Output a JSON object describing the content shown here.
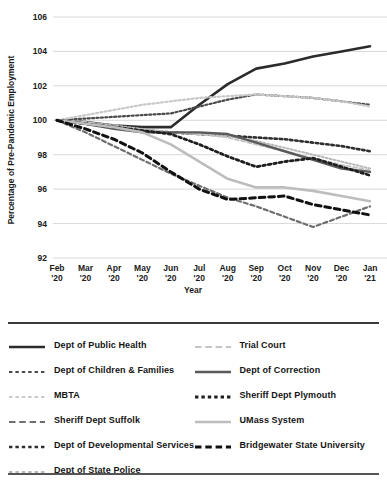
{
  "chart_data": {
    "type": "line",
    "title": "",
    "xlabel": "Year",
    "ylabel": "Percentage of Pre-Pandemic Employment",
    "categories": [
      "Feb '20",
      "Mar '20",
      "Apr '20",
      "May '20",
      "Jun '20",
      "Jul '20",
      "Aug '20",
      "Sep '20",
      "Oct '20",
      "Nov '20",
      "Dec '20",
      "Jan '21"
    ],
    "ylim": [
      92,
      106
    ],
    "yticks": [
      92,
      94,
      96,
      98,
      100,
      102,
      104,
      106
    ],
    "grid": true,
    "legend_position": "below",
    "series": [
      {
        "name": "Dept of Public Health",
        "color": "#2b2b2b",
        "style": "solid",
        "width": 2.6,
        "values": [
          100.0,
          99.9,
          99.7,
          99.6,
          99.6,
          100.9,
          102.1,
          103.0,
          103.3,
          103.7,
          104.0,
          104.3
        ]
      },
      {
        "name": "Dept of Children & Families",
        "color": "#4a4a4a",
        "style": "dotted",
        "width": 2.2,
        "values": [
          100.0,
          100.1,
          100.2,
          100.3,
          100.4,
          100.8,
          101.2,
          101.5,
          101.4,
          101.3,
          101.1,
          100.9
        ]
      },
      {
        "name": "MBTA",
        "color": "#c9c9c9",
        "style": "dotted",
        "width": 2.2,
        "values": [
          100.0,
          100.3,
          100.6,
          100.9,
          101.1,
          101.3,
          101.4,
          101.5,
          101.4,
          101.3,
          101.1,
          100.8
        ]
      },
      {
        "name": "Sheriff Dept Suffolk",
        "color": "#6e6e6e",
        "style": "dashed",
        "width": 2.2,
        "values": [
          100.0,
          99.3,
          98.5,
          97.7,
          96.9,
          96.2,
          95.5,
          95.0,
          94.4,
          93.8,
          94.4,
          95.0
        ]
      },
      {
        "name": "Dept of Developmental Services",
        "color": "#2e2e2e",
        "style": "dotted",
        "width": 2.6,
        "values": [
          100.0,
          99.8,
          99.6,
          99.4,
          99.3,
          99.2,
          99.1,
          99.0,
          98.9,
          98.7,
          98.5,
          98.2
        ]
      },
      {
        "name": "Dept of State Police",
        "color": "#b8b8b8",
        "style": "dotted",
        "width": 2.0,
        "values": [
          100.0,
          99.9,
          99.7,
          99.5,
          99.3,
          99.2,
          99.1,
          98.8,
          98.4,
          98.0,
          97.6,
          97.2
        ]
      },
      {
        "name": "Trial Court",
        "color": "#c4c4c4",
        "style": "dashed",
        "width": 2.0,
        "values": [
          100.0,
          99.9,
          99.6,
          99.4,
          99.3,
          99.2,
          99.0,
          98.6,
          98.2,
          97.8,
          97.4,
          97.1
        ]
      },
      {
        "name": "Dept of Correction",
        "color": "#5a5a5a",
        "style": "solid",
        "width": 2.4,
        "values": [
          100.0,
          99.8,
          99.5,
          99.3,
          99.3,
          99.3,
          99.2,
          98.7,
          98.2,
          97.7,
          97.2,
          97.0
        ]
      },
      {
        "name": "Sheriff Dept Plymouth",
        "color": "#1e1e1e",
        "style": "dotted",
        "width": 2.8,
        "values": [
          100.0,
          99.8,
          99.6,
          99.4,
          99.2,
          98.6,
          97.9,
          97.3,
          97.6,
          97.8,
          97.3,
          96.8
        ]
      },
      {
        "name": "UMass System",
        "color": "#bdbdbd",
        "style": "solid",
        "width": 2.6,
        "values": [
          100.0,
          99.8,
          99.6,
          99.3,
          98.6,
          97.6,
          96.6,
          96.1,
          96.1,
          95.9,
          95.6,
          95.3
        ]
      },
      {
        "name": "Bridgewater State University",
        "color": "#111111",
        "style": "dashed",
        "width": 3.0,
        "values": [
          100.0,
          99.5,
          98.9,
          98.1,
          97.0,
          96.0,
          95.4,
          95.5,
          95.6,
          95.1,
          94.8,
          94.5
        ]
      }
    ]
  },
  "legend": {
    "left_column": [
      {
        "label": "Dept of Public Health"
      },
      {
        "label": "Dept of Children & Families"
      },
      {
        "label": "MBTA"
      },
      {
        "label": "Sheriff Dept Suffolk"
      },
      {
        "label": "Dept of Developmental Services"
      },
      {
        "label": "Dept of State Police"
      }
    ],
    "right_column": [
      {
        "label": "Trial Court"
      },
      {
        "label": "Dept of Correction"
      },
      {
        "label": "Sheriff Dept Plymouth"
      },
      {
        "label": "UMass System"
      },
      {
        "label": "Bridgewater State University"
      }
    ]
  }
}
